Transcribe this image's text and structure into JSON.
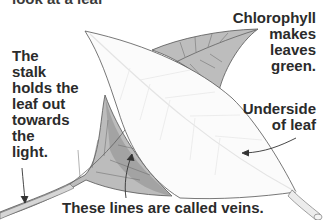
{
  "diagram": {
    "title": "look at a leaf",
    "labels": {
      "stalk": "The\nstalk\nholds the\nleaf out\ntowards\nthe\nlight.",
      "chlorophyll": "Chlorophyll\nmakes\nleaves\ngreen.",
      "underside": "Underside\nof leaf",
      "veins": "These lines are called veins."
    },
    "colors": {
      "background": "#ffffff",
      "text": "#2b2b2b",
      "leaf_top_fill": "#b8b8b8",
      "leaf_dark_fill": "#8e8e8e",
      "leaf_underside_fill": "#fbfbfb",
      "outline": "#555555",
      "vein_light": "#e6e6e6"
    }
  }
}
